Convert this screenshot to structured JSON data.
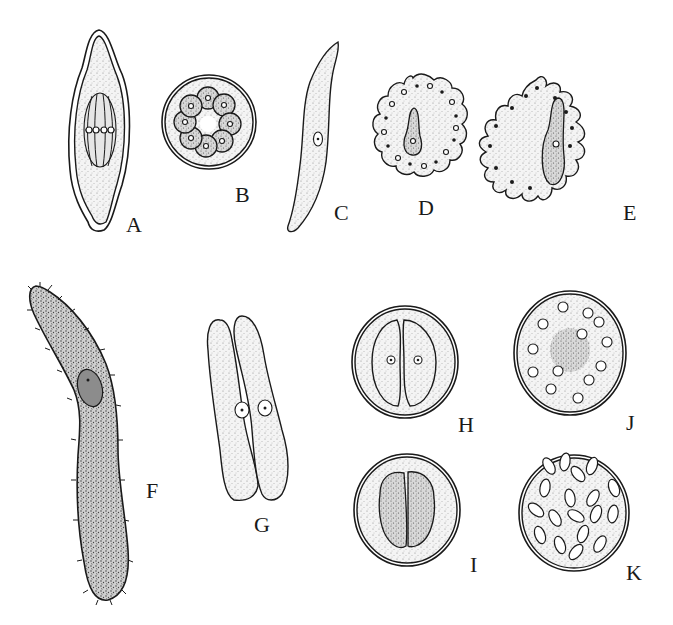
{
  "figure": {
    "background": "#ffffff",
    "ink_color": "#1a1a1a",
    "panels": [
      {
        "label": "A",
        "description": "spindle-shaped cyst with spindle/nuclear division inside"
      },
      {
        "label": "B",
        "description": "round cyst containing ring of 8 nucleated cells"
      },
      {
        "label": "C",
        "description": "elongated curved sporozoite-like cell with single nucleus"
      },
      {
        "label": "D",
        "description": "rounded cell with scalloped margin of nuclei and central elongated nucleus"
      },
      {
        "label": "E",
        "description": "cell with pointed peripheral buds each with nucleus and central elongated nucleus"
      },
      {
        "label": "F",
        "description": "large elongated ciliated cell with oval nucleus"
      },
      {
        "label": "G",
        "description": "two paired elongate cells side by side each with a nucleus"
      },
      {
        "label": "H",
        "description": "round cyst containing two paired cells with nuclei"
      },
      {
        "label": "I",
        "description": "round cyst with two granular paired cells"
      },
      {
        "label": "J",
        "description": "round cyst with scattered dividing nuclei around central granular mass"
      },
      {
        "label": "K",
        "description": "round cyst packed with spindle-shaped spores"
      }
    ]
  }
}
